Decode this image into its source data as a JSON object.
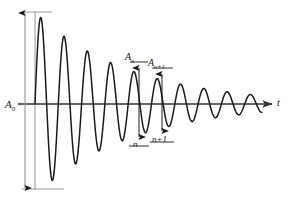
{
  "figure": {
    "background": "#ffffff",
    "curve_color": "#1a1a1a",
    "axis_color": "#333333",
    "guide_color": "#8a8a8a"
  },
  "labels": {
    "amplitude_initial": "A",
    "amplitude_initial_sub": "0",
    "amplitude_n": "A",
    "amplitude_n_sub": "n",
    "amplitude_n_plus_1": "A",
    "amplitude_n_plus_1_sub": "n+1",
    "index_n": "n",
    "index_n_plus_1": "n+1",
    "axis_t": "t"
  },
  "chart_data": {
    "type": "line",
    "title": "",
    "xlabel": "t",
    "ylabel": "",
    "grid": false,
    "legend": null,
    "annotations": [
      {
        "name": "A0-arrow",
        "text": "A₀",
        "kind": "double-arrow-vertical",
        "x": 25,
        "y_top": 12,
        "y_bottom": 189,
        "note": "initial peak-to-trough amplitude"
      },
      {
        "name": "An-arrow",
        "text": "Aₙ",
        "kind": "double-arrow-vertical",
        "x": 139,
        "y_top": 67,
        "y_bottom": 138,
        "note": "amplitude at cycle n"
      },
      {
        "name": "An1-arrow",
        "text": "Aₙ₊₁",
        "kind": "double-arrow-vertical",
        "x": 162,
        "y_top": 73,
        "y_bottom": 132,
        "note": "amplitude at cycle n+1"
      },
      {
        "name": "n-tick",
        "text": "n",
        "kind": "baseline-tick",
        "x": 139
      },
      {
        "name": "n-plus-1-tick",
        "text": "n+1",
        "kind": "baseline-tick",
        "x": 162
      }
    ],
    "function": "A(t) = A0 * exp(-t/tau) * sin(2*pi*t/T)",
    "parameters": {
      "A0": 1.0,
      "tau_px": 95,
      "period_px": 23.3,
      "t_start_px": 35,
      "t_end_px": 262,
      "baseline_y_px": 104,
      "peak_amplitude_px": 92
    },
    "peaks": [
      {
        "cycle": 1,
        "x": 45,
        "y": 12,
        "amplitude": 0.92
      },
      {
        "cycle": 2,
        "x": 68,
        "y": 33,
        "amplitude": 0.72
      },
      {
        "cycle": 3,
        "x": 91,
        "y": 48,
        "amplitude": 0.56
      },
      {
        "cycle": 4,
        "x": 115,
        "y": 60,
        "amplitude": 0.44
      },
      {
        "cycle": 5,
        "x": 139,
        "y": 67,
        "amplitude": 0.36
      },
      {
        "cycle": 6,
        "x": 162,
        "y": 73,
        "amplitude": 0.3
      },
      {
        "cycle": 7,
        "x": 185,
        "y": 79,
        "amplitude": 0.24
      },
      {
        "cycle": 8,
        "x": 208,
        "y": 84,
        "amplitude": 0.19
      },
      {
        "cycle": 9,
        "x": 231,
        "y": 88,
        "amplitude": 0.15
      },
      {
        "cycle": 10,
        "x": 254,
        "y": 92,
        "amplitude": 0.12
      }
    ],
    "troughs": [
      {
        "cycle": 1,
        "x": 57,
        "y": 189,
        "amplitude": -0.82
      },
      {
        "cycle": 2,
        "x": 80,
        "y": 162,
        "amplitude": -0.63
      },
      {
        "cycle": 3,
        "x": 103,
        "y": 142,
        "amplitude": -0.49
      },
      {
        "cycle": 4,
        "x": 127,
        "y": 131,
        "amplitude": -0.39
      },
      {
        "cycle": 5,
        "x": 150,
        "y": 138,
        "amplitude": -0.33
      },
      {
        "cycle": 6,
        "x": 173,
        "y": 132,
        "amplitude": -0.27
      },
      {
        "cycle": 7,
        "x": 196,
        "y": 126,
        "amplitude": -0.21
      },
      {
        "cycle": 8,
        "x": 219,
        "y": 121,
        "amplitude": -0.17
      },
      {
        "cycle": 9,
        "x": 242,
        "y": 117,
        "amplitude": -0.13
      }
    ]
  }
}
